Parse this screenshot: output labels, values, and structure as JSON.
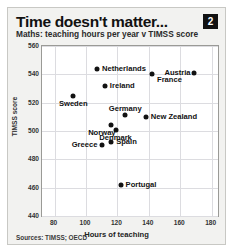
{
  "card": {
    "title": "Time doesn't matter...",
    "badge": "2",
    "subtitle": "Maths: teaching hours per year v TIMSS score",
    "source": "Sources: TIMSS; OECD"
  },
  "chart_data": {
    "type": "scatter",
    "title": "Time doesn't matter...",
    "subtitle": "Maths: teaching hours per year v TIMSS score",
    "xlabel": "Hours of teaching",
    "ylabel": "TIMSS score",
    "xlim": [
      72,
      184
    ],
    "ylim": [
      440,
      560
    ],
    "xticks": [
      80,
      100,
      120,
      140,
      160,
      180
    ],
    "yticks": [
      440,
      460,
      480,
      500,
      520,
      540,
      560
    ],
    "grid": true,
    "legend": "none",
    "marker_color": "#121212",
    "points": [
      {
        "label": "Netherlands",
        "x": 107,
        "y": 544,
        "label_pos": "right"
      },
      {
        "label": "Austria",
        "x": 169,
        "y": 541,
        "label_pos": "left"
      },
      {
        "label": "France",
        "x": 142,
        "y": 540,
        "label_pos": "right-below"
      },
      {
        "label": "Ireland",
        "x": 112,
        "y": 532,
        "label_pos": "right"
      },
      {
        "label": "Sweden",
        "x": 92,
        "y": 525,
        "label_pos": "below"
      },
      {
        "label": "Germany",
        "x": 125,
        "y": 511,
        "label_pos": "above"
      },
      {
        "label": "New Zealand",
        "x": 138,
        "y": 510,
        "label_pos": "right"
      },
      {
        "label": "Norway",
        "x": 116,
        "y": 504,
        "label_pos": "below-left"
      },
      {
        "label": "Denmark",
        "x": 119,
        "y": 501,
        "label_pos": "below"
      },
      {
        "label": "Spain",
        "x": 116,
        "y": 492,
        "label_pos": "right"
      },
      {
        "label": "Greece",
        "x": 110,
        "y": 490,
        "label_pos": "left"
      },
      {
        "label": "Portugal",
        "x": 122,
        "y": 462,
        "label_pos": "right"
      }
    ]
  }
}
